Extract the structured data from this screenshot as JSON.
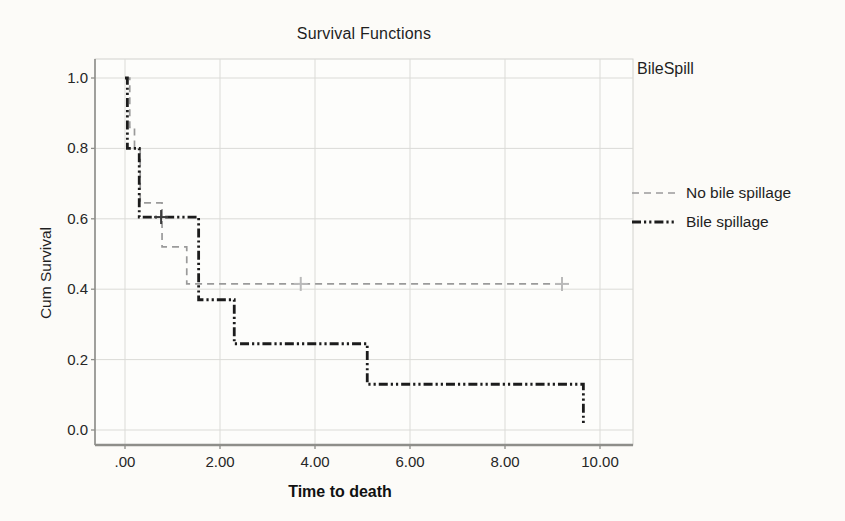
{
  "chart_data": {
    "type": "line",
    "subtype": "kaplan-meier-step",
    "title": "Survival Functions",
    "xlabel": "Time to death",
    "ylabel": "Cum Survival",
    "legend_title": "BileSpill",
    "xlim": [
      0,
      10
    ],
    "ylim": [
      0.0,
      1.0
    ],
    "grid": true,
    "legend_position": "right",
    "x_ticks": [
      {
        "value": 0,
        "label": ".00"
      },
      {
        "value": 2,
        "label": "2.00"
      },
      {
        "value": 4,
        "label": "4.00"
      },
      {
        "value": 6,
        "label": "6.00"
      },
      {
        "value": 8,
        "label": "8.00"
      },
      {
        "value": 10,
        "label": "10.00"
      }
    ],
    "y_ticks": [
      {
        "value": 1.0,
        "label": "1.0"
      },
      {
        "value": 0.8,
        "label": "0.8"
      },
      {
        "value": 0.6,
        "label": "0.6"
      },
      {
        "value": 0.4,
        "label": "0.4"
      },
      {
        "value": 0.2,
        "label": "0.2"
      },
      {
        "value": 0.0,
        "label": "0.0"
      }
    ],
    "series": [
      {
        "name": "No bile spillage",
        "color": "#9a9a9a",
        "censor_color": "#b9b9b9",
        "style": "dashed",
        "start": {
          "x": 0,
          "y": 1.0
        },
        "steps": [
          {
            "x": 0.1,
            "y": 0.86
          },
          {
            "x": 0.2,
            "y": 0.8
          },
          {
            "x": 0.32,
            "y": 0.645
          },
          {
            "x": 0.78,
            "y": 0.52
          },
          {
            "x": 1.3,
            "y": 0.415
          }
        ],
        "end_x": 9.2,
        "censored": [
          {
            "x": 3.7,
            "y": 0.415
          },
          {
            "x": 9.2,
            "y": 0.415
          }
        ]
      },
      {
        "name": "Bile spillage",
        "color": "#1c1c1c",
        "censor_color": "#3c3c3c",
        "style": "dash-dot-dot",
        "start": {
          "x": 0,
          "y": 1.0
        },
        "steps": [
          {
            "x": 0.05,
            "y": 0.8
          },
          {
            "x": 0.3,
            "y": 0.605
          },
          {
            "x": 1.55,
            "y": 0.37
          },
          {
            "x": 2.3,
            "y": 0.245
          },
          {
            "x": 5.1,
            "y": 0.13
          },
          {
            "x": 9.65,
            "y": 0.015
          }
        ],
        "end_x": 9.65,
        "censored": [
          {
            "x": 0.76,
            "y": 0.605
          }
        ]
      }
    ]
  }
}
